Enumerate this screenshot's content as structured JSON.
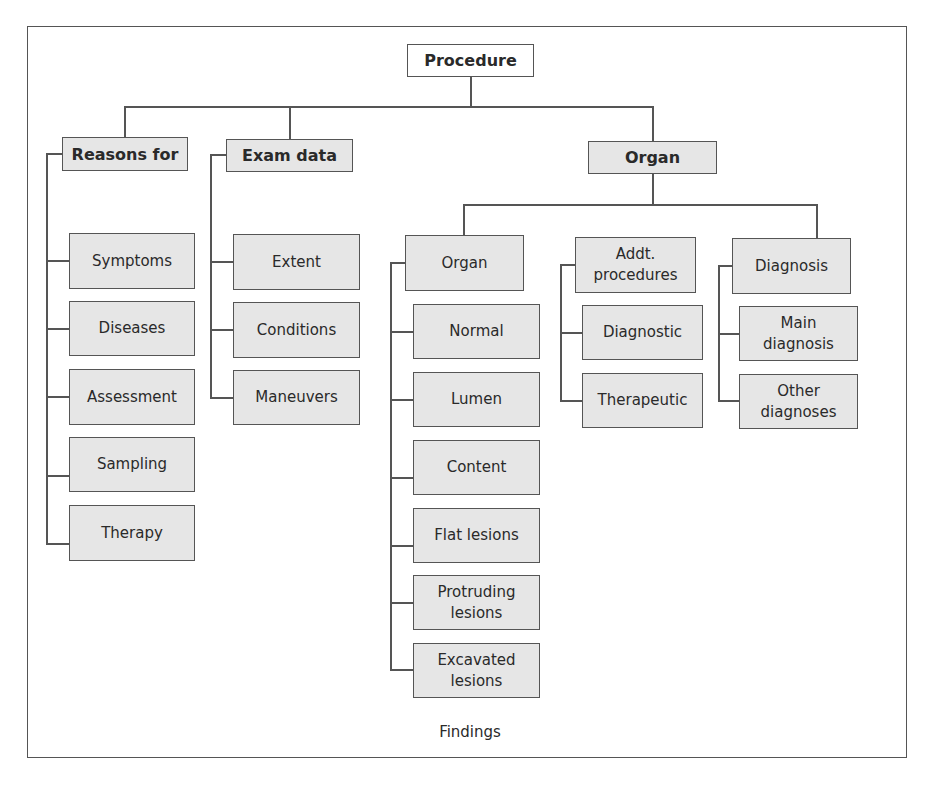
{
  "diagram": {
    "root": "Procedure",
    "level1": {
      "reasons": "Reasons for",
      "exam": "Exam data",
      "organ": "Organ"
    },
    "reasons_children": [
      "Symptoms",
      "Diseases",
      "Assessment",
      "Sampling",
      "Therapy"
    ],
    "exam_children": [
      "Extent",
      "Conditions",
      "Maneuvers"
    ],
    "organ_level2": {
      "organ": "Organ",
      "addt": "Addt. procedures",
      "diagnosis": "Diagnosis"
    },
    "organ_children": [
      "Normal",
      "Lumen",
      "Content",
      "Flat lesions",
      "Protruding lesions",
      "Excavated lesions"
    ],
    "addt_children": [
      "Diagnostic",
      "Therapeutic"
    ],
    "diagnosis_children": [
      "Main diagnosis",
      "Other diagnoses"
    ],
    "footer_label": "Findings"
  },
  "colors": {
    "box_fill": "#e6e6e6",
    "line": "#555555",
    "root_fill": "#ffffff"
  }
}
